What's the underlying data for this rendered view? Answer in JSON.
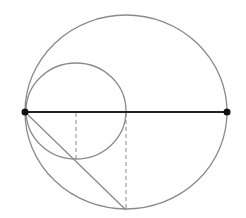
{
  "diagram": {
    "width": 246,
    "height": 218,
    "colors": {
      "circle_stroke": "#8a8a8a",
      "diameter_stroke": "#222222",
      "point_fill": "#111111",
      "dashed_stroke": "#8a8a8a",
      "chord_stroke": "#8a8a8a"
    },
    "large_circle": {
      "cx": 126,
      "cy": 112,
      "rx": 101,
      "ry": 97
    },
    "small_circle": {
      "cx": 76,
      "cy": 111,
      "rx": 50,
      "ry": 48
    },
    "diameter": {
      "x1": 25,
      "y1": 112,
      "x2": 227,
      "y2": 112
    },
    "points": [
      {
        "name": "left-endpoint",
        "x": 25,
        "y": 112
      },
      {
        "name": "right-endpoint",
        "x": 227,
        "y": 112
      }
    ],
    "chord": {
      "x1": 25,
      "y1": 112,
      "x2": 126,
      "y2": 210
    },
    "dashed_lines": [
      {
        "x1": 76,
        "y1": 113,
        "x2": 76,
        "y2": 159
      },
      {
        "x1": 126,
        "y1": 113,
        "x2": 126,
        "y2": 209
      }
    ]
  }
}
